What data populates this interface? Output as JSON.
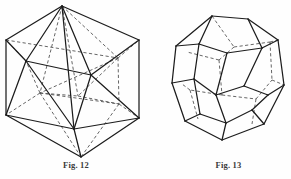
{
  "page": {
    "background_color": "#fefefe",
    "ink_color": "#1c1c1c",
    "hidden_edge_color": "#4a4a4a",
    "width": 291,
    "height": 179
  },
  "figures": [
    {
      "id": "icosahedron",
      "caption": "Fig. 12",
      "solid_name": "icosahedron",
      "faces": 20,
      "edges": 30,
      "vertices": 12,
      "outline_shape": "hexagon",
      "visible_edge_style": "solid",
      "hidden_edge_style": "dashed"
    },
    {
      "id": "dodecahedron",
      "caption": "Fig. 13",
      "solid_name": "dodecahedron",
      "faces": 12,
      "edges": 30,
      "vertices": 20,
      "outline_shape": "decagon",
      "visible_edge_style": "solid",
      "hidden_edge_style": "dashed"
    }
  ],
  "captions": {
    "fig12": "Fig. 12",
    "fig13": "Fig. 13"
  }
}
